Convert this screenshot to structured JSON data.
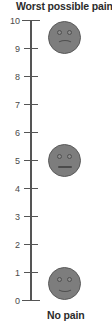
{
  "figure": {
    "kind": "vertical-numeric-rating-pain-scale",
    "top_label": "Worst possible pain",
    "bottom_label": "No pain"
  },
  "chart_data": {
    "type": "scatter",
    "title": "Worst possible pain",
    "subtitle": "No pain",
    "xlabel": "",
    "ylabel": "",
    "orientation": "vertical",
    "grid": false,
    "legend": "none",
    "ylim": [
      0,
      10
    ],
    "ytick_labels": [
      "10",
      "9",
      "8",
      "7",
      "6",
      "5",
      "4",
      "3",
      "2",
      "1",
      "0"
    ],
    "yticks": [
      10,
      9,
      8,
      7,
      6,
      5,
      4,
      3,
      2,
      1,
      0
    ],
    "categories": [
      "worst possible pain",
      "moderate pain",
      "no pain"
    ],
    "values": [
      9.4,
      5.0,
      0.6
    ],
    "annotations": [
      {
        "name": "sad-face",
        "value": 9.4,
        "expression": "frowning",
        "color": "#7d7d7d"
      },
      {
        "name": "neutral-face",
        "value": 5.0,
        "expression": "neutral",
        "color": "#7d7d7d"
      },
      {
        "name": "happy-face",
        "value": 0.6,
        "expression": "smiling",
        "color": "#7d7d7d"
      }
    ]
  },
  "axis": {
    "line_color": "#555555",
    "label_color": "#4a4a4a",
    "ticks": [
      {
        "label": "10",
        "value": 10,
        "endcap": true
      },
      {
        "label": "9",
        "value": 9,
        "endcap": false
      },
      {
        "label": "8",
        "value": 8,
        "endcap": false
      },
      {
        "label": "7",
        "value": 7,
        "endcap": false
      },
      {
        "label": "6",
        "value": 6,
        "endcap": false
      },
      {
        "label": "5",
        "value": 5,
        "endcap": false
      },
      {
        "label": "4",
        "value": 4,
        "endcap": false
      },
      {
        "label": "3",
        "value": 3,
        "endcap": false
      },
      {
        "label": "2",
        "value": 2,
        "endcap": false
      },
      {
        "label": "1",
        "value": 1,
        "endcap": false
      },
      {
        "label": "0",
        "value": 0,
        "endcap": true
      }
    ]
  },
  "faces": [
    {
      "name": "sad-face",
      "expression": "sad",
      "value": 9.4,
      "icon": "frowning-face-icon"
    },
    {
      "name": "neutral-face",
      "expression": "neutral",
      "value": 5.0,
      "icon": "neutral-face-icon"
    },
    {
      "name": "happy-face",
      "expression": "happy",
      "value": 0.6,
      "icon": "smiling-face-icon"
    }
  ],
  "colors": {
    "face_fill": "#7d7d7d",
    "face_stroke": "#5a5a5a",
    "axis": "#555555",
    "text": "#2b2b2b",
    "tick_text": "#4a4a4a",
    "background": "#ffffff"
  }
}
